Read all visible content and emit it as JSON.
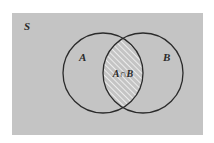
{
  "diagram": {
    "type": "venn",
    "universe_label": "S",
    "sets": [
      {
        "label": "A"
      },
      {
        "label": "B"
      }
    ],
    "intersection_label": "A∩B",
    "colors": {
      "universe_fill": "#c4c4c4",
      "circle_stroke": "#2b2b2b",
      "hatch_line": "#ececec"
    }
  }
}
